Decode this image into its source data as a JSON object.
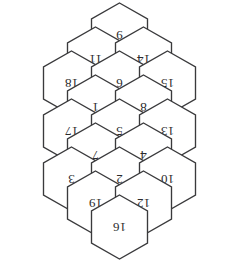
{
  "figure": {
    "rotation_degrees": 180,
    "hex_count": 19,
    "colors": {
      "background": "#ffffff",
      "stroke": "#3a3a3c",
      "fill": "#ffffff",
      "label": "#2b2b2d"
    }
  },
  "geometry": {
    "cell_width": 56,
    "cell_height": 64,
    "row_step": 24,
    "col_step": 48,
    "center_x": 119.5,
    "center_y": 131
  },
  "chart_data": {
    "type": "table",
    "rows": [
      {
        "row": 0,
        "labels": [
          "9"
        ]
      },
      {
        "row": 1,
        "labels": [
          "11",
          "14"
        ]
      },
      {
        "row": 2,
        "labels": [
          "18",
          "6",
          "15"
        ]
      },
      {
        "row": 3,
        "labels": [
          "1",
          "8"
        ]
      },
      {
        "row": 4,
        "labels": [
          "17",
          "5",
          "13"
        ]
      },
      {
        "row": 5,
        "labels": [
          "7",
          "4"
        ]
      },
      {
        "row": 6,
        "labels": [
          "3",
          "2",
          "10"
        ]
      },
      {
        "row": 7,
        "labels": [
          "19",
          "12"
        ]
      },
      {
        "row": 8,
        "labels": [
          "16"
        ]
      }
    ]
  },
  "cells": [
    {
      "id": "hex-9",
      "label": "9",
      "cx": 119.5,
      "cy": 35
    },
    {
      "id": "hex-11",
      "label": "11",
      "cx": 95.5,
      "cy": 59
    },
    {
      "id": "hex-14",
      "label": "14",
      "cx": 143.5,
      "cy": 59
    },
    {
      "id": "hex-18",
      "label": "18",
      "cx": 71.5,
      "cy": 83
    },
    {
      "id": "hex-6",
      "label": "6",
      "cx": 119.5,
      "cy": 83
    },
    {
      "id": "hex-15",
      "label": "15",
      "cx": 167.5,
      "cy": 83
    },
    {
      "id": "hex-1",
      "label": "1",
      "cx": 95.5,
      "cy": 107
    },
    {
      "id": "hex-8",
      "label": "8",
      "cx": 143.5,
      "cy": 107
    },
    {
      "id": "hex-17",
      "label": "17",
      "cx": 71.5,
      "cy": 131
    },
    {
      "id": "hex-5",
      "label": "5",
      "cx": 119.5,
      "cy": 131
    },
    {
      "id": "hex-13",
      "label": "13",
      "cx": 167.5,
      "cy": 131
    },
    {
      "id": "hex-7",
      "label": "7",
      "cx": 95.5,
      "cy": 155
    },
    {
      "id": "hex-4",
      "label": "4",
      "cx": 143.5,
      "cy": 155
    },
    {
      "id": "hex-3",
      "label": "3",
      "cx": 71.5,
      "cy": 179
    },
    {
      "id": "hex-2",
      "label": "2",
      "cx": 119.5,
      "cy": 179
    },
    {
      "id": "hex-10",
      "label": "10",
      "cx": 167.5,
      "cy": 179
    },
    {
      "id": "hex-19",
      "label": "19",
      "cx": 95.5,
      "cy": 203
    },
    {
      "id": "hex-12",
      "label": "12",
      "cx": 143.5,
      "cy": 203
    },
    {
      "id": "hex-16",
      "label": "16",
      "cx": 119.5,
      "cy": 227
    }
  ]
}
